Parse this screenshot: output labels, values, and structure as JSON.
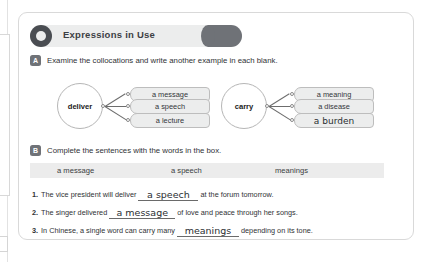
{
  "header": {
    "title": "Expressions in Use",
    "icon": "ring-icon"
  },
  "sections": [
    {
      "marker": "A",
      "instruction": "Examine the collocations and write another example in each blank."
    },
    {
      "marker": "B",
      "instruction": "Complete the sentences with the words in the box."
    }
  ],
  "diagrams": [
    {
      "verb": "deliver",
      "tags": [
        {
          "text": "a message",
          "filled": false
        },
        {
          "text": "a speech",
          "filled": false
        },
        {
          "text": "a lecture",
          "filled": false
        }
      ]
    },
    {
      "verb": "carry",
      "tags": [
        {
          "text": "a meaning",
          "filled": false
        },
        {
          "text": "a disease",
          "filled": false
        },
        {
          "text": "a burden",
          "filled": true
        }
      ]
    }
  ],
  "wordbank": {
    "words": [
      "a message",
      "a speech",
      "meanings"
    ]
  },
  "sentences": [
    {
      "number": "1.",
      "before": "The vice president will deliver",
      "answer": "a speech",
      "after": "at the forum tomorrow."
    },
    {
      "number": "2.",
      "before": "The singer delivered",
      "answer": "a message",
      "after": "of love and peace through her songs."
    },
    {
      "number": "3.",
      "before": "In Chinese, a single word can carry many",
      "answer": "meanings",
      "after": "depending on its tone."
    }
  ],
  "colors": {
    "card_border": "#d9d9d9",
    "header_bar": "#eceded",
    "header_cap": "#6f7277",
    "marker": "#6f7277",
    "tag_fill": "#eceded",
    "wordbank_fill": "#ececec"
  }
}
